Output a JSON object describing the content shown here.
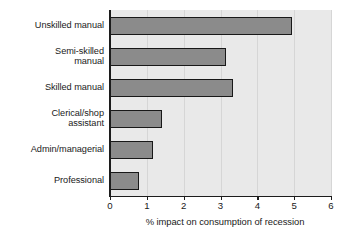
{
  "chart_data": {
    "type": "bar",
    "orientation": "horizontal",
    "title": "",
    "xlabel": "% impact on consumption of recession",
    "ylabel": "",
    "xlim": [
      0,
      6
    ],
    "xticks": [
      "0",
      "1",
      "2",
      "3",
      "4",
      "5",
      "6"
    ],
    "grid": true,
    "legend": null,
    "categories": [
      "Unskilled manual",
      "Semi-skilled\nmanual",
      "Skilled manual",
      "Clerical/shop\nassistant",
      "Admin/managerial",
      "Professional"
    ],
    "values": [
      4.95,
      3.15,
      3.35,
      1.42,
      1.17,
      0.78
    ],
    "bars": [
      {
        "label": "Unskilled manual",
        "label_line1": "Unskilled manual",
        "label_line2": "",
        "value": 4.95
      },
      {
        "label": "Semi-skilled manual",
        "label_line1": "Semi-skilled",
        "label_line2": "manual",
        "value": 3.15
      },
      {
        "label": "Skilled manual",
        "label_line1": "Skilled manual",
        "label_line2": "",
        "value": 3.35
      },
      {
        "label": "Clerical/shop assistant",
        "label_line1": "Clerical/shop",
        "label_line2": "assistant",
        "value": 1.42
      },
      {
        "label": "Admin/managerial",
        "label_line1": "Admin/managerial",
        "label_line2": "",
        "value": 1.17
      },
      {
        "label": "Professional",
        "label_line1": "Professional",
        "label_line2": "",
        "value": 0.78
      }
    ],
    "colors": {
      "bar_fill": "#8b8b8b",
      "bar_edge": "#181818",
      "plot_background": "#e9e9e9",
      "gridline": "#d6d6d6",
      "axis": "#1c1c1c",
      "text": "#1a1a1a",
      "figure_background": "#ffffff"
    }
  }
}
